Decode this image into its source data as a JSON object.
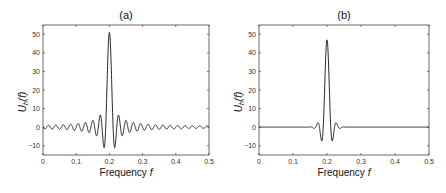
{
  "chart_data": [
    {
      "type": "line",
      "title": "(a)",
      "xlabel": "Frequency f",
      "ylabel": "U_h(f)",
      "xlim": [
        0,
        0.5
      ],
      "ylim": [
        -15,
        55
      ],
      "xticks": [
        "0",
        "0.1",
        "0.2",
        "0.3",
        "0.4",
        "0.5"
      ],
      "yticks": [
        "-10",
        "0",
        "10",
        "20",
        "30",
        "40",
        "50"
      ],
      "grid": false,
      "description": "Sinc-like spectral window with slowly decaying sidelobes centered at f=0.2",
      "peak": {
        "x": 0.2,
        "y": 51
      },
      "first_minima": [
        {
          "x": 0.188,
          "y": -11
        },
        {
          "x": 0.212,
          "y": -11
        }
      ],
      "first_sidelobes": [
        {
          "x": 0.177,
          "y": 7
        },
        {
          "x": 0.223,
          "y": 6.5
        }
      ],
      "sidelobe_amplitude_far": 1.5,
      "sidelobe_period": 0.011
    },
    {
      "type": "line",
      "title": "(b)",
      "xlabel": "Frequency f",
      "ylabel": "U_h(f)",
      "xlim": [
        0,
        0.5
      ],
      "ylim": [
        -15,
        55
      ],
      "xticks": [
        "0",
        "0.1",
        "0.2",
        "0.3",
        "0.4",
        "0.5"
      ],
      "yticks": [
        "-10",
        "0",
        "10",
        "20",
        "30",
        "40",
        "50"
      ],
      "grid": false,
      "description": "Tapered spectral window centered at f=0.2 with rapidly decaying sidelobes",
      "peak": {
        "x": 0.2,
        "y": 47
      },
      "first_minima": [
        {
          "x": 0.186,
          "y": -9
        },
        {
          "x": 0.214,
          "y": -9
        }
      ],
      "first_sidelobes": [
        {
          "x": 0.171,
          "y": 4
        },
        {
          "x": 0.229,
          "y": 4
        }
      ],
      "sidelobe_amplitude_far": 0
    }
  ]
}
